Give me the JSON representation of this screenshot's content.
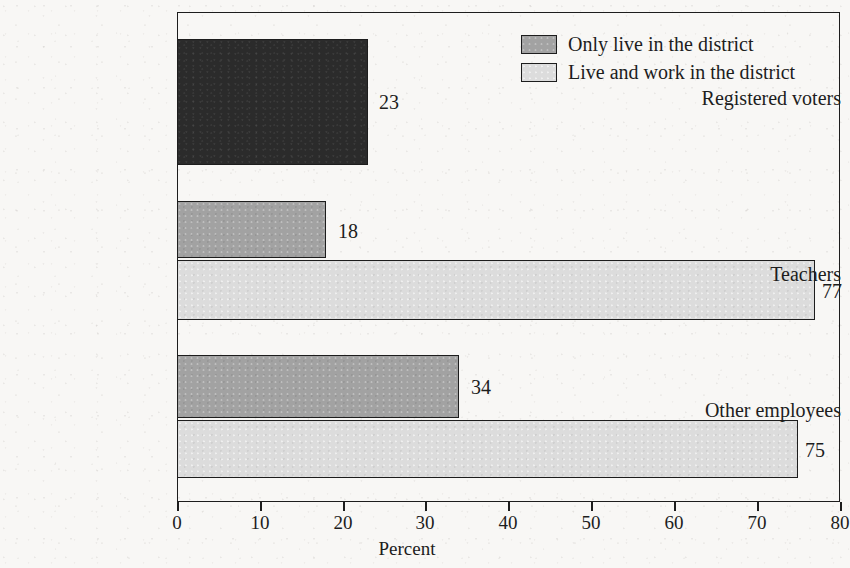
{
  "chart_data": {
    "type": "bar",
    "orientation": "horizontal",
    "title": "",
    "xlabel": "Percent",
    "ylabel": "",
    "xlim": [
      0,
      80
    ],
    "xticks": [
      0,
      10,
      20,
      30,
      40,
      50,
      60,
      70,
      80
    ],
    "xtick_labels": [
      "0",
      "10",
      "20",
      "30",
      "40",
      "50",
      "60",
      "70",
      "80"
    ],
    "grid": false,
    "legend_position": "top-right",
    "categories": [
      "Registered voters",
      "Teachers",
      "Other employees"
    ],
    "series": [
      {
        "name": "Only live in the district",
        "color": "#a2a2a2",
        "values": [
          23,
          18,
          34
        ],
        "value_labels": [
          "23",
          "18",
          "34"
        ]
      },
      {
        "name": "Live and work in the district",
        "color": "#dcdcdc",
        "values": [
          null,
          77,
          75
        ],
        "value_labels": [
          "",
          "77",
          "75"
        ]
      }
    ],
    "bars": [
      {
        "category": "Registered voters",
        "series": "Only live in the district",
        "value": 23,
        "label": "23",
        "fill": "dark"
      },
      {
        "category": "Teachers",
        "series": "Only live in the district",
        "value": 18,
        "label": "18",
        "fill": "mid"
      },
      {
        "category": "Teachers",
        "series": "Live and work in the district",
        "value": 77,
        "label": "77",
        "fill": "light"
      },
      {
        "category": "Other employees",
        "series": "Only live in the district",
        "value": 34,
        "label": "34",
        "fill": "mid"
      },
      {
        "category": "Other employees",
        "series": "Live and work in the district",
        "value": 75,
        "label": "75",
        "fill": "light"
      }
    ]
  },
  "axis": {
    "x_title": "Percent",
    "ticks": [
      {
        "value": "0",
        "x": 177
      },
      {
        "value": "10",
        "x": 260
      },
      {
        "value": "20",
        "x": 343
      },
      {
        "value": "30",
        "x": 425
      },
      {
        "value": "40",
        "x": 508
      },
      {
        "value": "50",
        "x": 591
      },
      {
        "value": "60",
        "x": 674
      },
      {
        "value": "70",
        "x": 757
      },
      {
        "value": "80",
        "x": 840
      }
    ]
  },
  "categories": [
    {
      "label": "Registered voters",
      "top": 88
    },
    {
      "label": "Teachers",
      "top": 264
    },
    {
      "label": "Other employees",
      "top": 400
    }
  ],
  "bars": [
    {
      "label": "23",
      "fill": "dark",
      "top": 39,
      "height": 126,
      "width": 191,
      "label_x": 379,
      "label_y": 92
    },
    {
      "label": "18",
      "fill": "mid",
      "top": 201,
      "height": 57,
      "width": 149,
      "label_x": 338,
      "label_y": 221
    },
    {
      "label": "77",
      "fill": "light",
      "top": 260,
      "height": 60,
      "width": 638,
      "label_x": 822,
      "label_y": 281
    },
    {
      "label": "34",
      "fill": "mid",
      "top": 355,
      "height": 63,
      "width": 282,
      "label_x": 471,
      "label_y": 377
    },
    {
      "label": "75",
      "fill": "light",
      "top": 420,
      "height": 58,
      "width": 621,
      "label_x": 805,
      "label_y": 440
    }
  ],
  "legend": {
    "items": [
      {
        "label": "Only live in the district",
        "fill": "mid"
      },
      {
        "label": "Live and work in the district",
        "fill": "light"
      }
    ]
  }
}
